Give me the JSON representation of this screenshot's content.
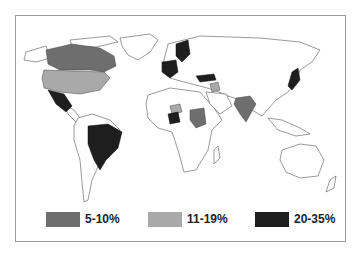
{
  "map": {
    "type": "choropleth",
    "region": "world",
    "colors": {
      "low": "#6e6e6e",
      "mid": "#a9a9a9",
      "high": "#1e1e1e",
      "nodata": "#ffffff",
      "border": "#555555"
    },
    "highlighted_regions": [
      {
        "name": "Canada",
        "class": "5-10%"
      },
      {
        "name": "United States",
        "class": "11-19%"
      },
      {
        "name": "Mexico",
        "class": "20-35%"
      },
      {
        "name": "Brazil",
        "class": "20-35%"
      },
      {
        "name": "Scandinavia",
        "class": "20-35%"
      },
      {
        "name": "Western Europe",
        "class": "20-35%"
      },
      {
        "name": "Turkey",
        "class": "20-35%"
      },
      {
        "name": "Iraq",
        "class": "11-19%"
      },
      {
        "name": "Nigeria",
        "class": "20-35%"
      },
      {
        "name": "Niger",
        "class": "11-19%"
      },
      {
        "name": "Sudan",
        "class": "5-10%"
      },
      {
        "name": "India",
        "class": "5-10%"
      },
      {
        "name": "Japan",
        "class": "20-35%"
      }
    ]
  },
  "legend": {
    "items": [
      {
        "label": "5-10%",
        "color": "#6e6e6e"
      },
      {
        "label": "11-19%",
        "color": "#a9a9a9"
      },
      {
        "label": "20-35%",
        "color": "#1e1e1e"
      }
    ]
  }
}
